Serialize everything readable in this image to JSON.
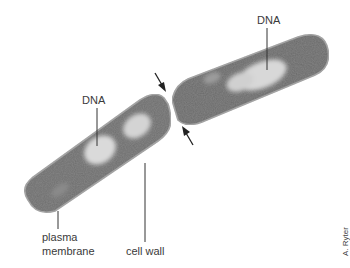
{
  "figure": {
    "labels": {
      "dna_top": "DNA",
      "dna_left": "DNA",
      "plasma_membrane_line1": "plasma",
      "plasma_membrane_line2": "membrane",
      "cell_wall": "cell wall"
    },
    "credit": "A. Ryter",
    "arrows": [
      {
        "name": "constriction-arrow-top",
        "direction": "down-right"
      },
      {
        "name": "constriction-arrow-bottom",
        "direction": "up-left"
      }
    ],
    "colors": {
      "background": "#ffffff",
      "cytoplasm": "#6e6e6e",
      "cytoplasm_dark": "#4a4a4a",
      "nucleoid": "#d8d8d8",
      "outline": "#9a9a9a",
      "leader": "#333333"
    }
  }
}
